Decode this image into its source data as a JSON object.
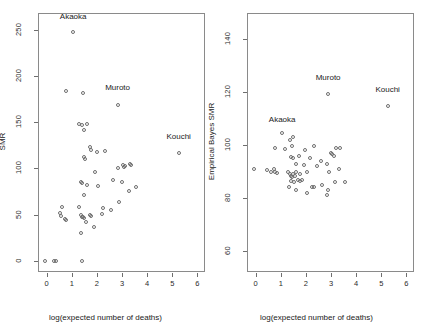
{
  "figure": {
    "panels": [
      {
        "id": "raw-smr",
        "xlabel": "log(expected number of deaths)",
        "ylabel": "SMR",
        "xticks": [
          "0",
          "1",
          "2",
          "3",
          "4",
          "5",
          "6"
        ],
        "yticks": [
          "0",
          "50",
          "100",
          "150",
          "200",
          "250"
        ]
      },
      {
        "id": "eb-smr",
        "xlabel": "log(expected number of deaths)",
        "ylabel": "Empirical Bayes SMR",
        "xticks": [
          "0",
          "1",
          "2",
          "3",
          "4",
          "5",
          "6"
        ],
        "yticks": [
          "60",
          "80",
          "100",
          "120",
          "140"
        ]
      }
    ]
  },
  "chart_data": [
    {
      "type": "scatter",
      "title": "",
      "xlabel": "log(expected number of deaths)",
      "ylabel": "SMR",
      "xlim": [
        -0.35,
        6.3
      ],
      "ylim": [
        -12,
        268
      ],
      "xticks": [
        0,
        1,
        2,
        3,
        4,
        5,
        6
      ],
      "yticks": [
        0,
        50,
        100,
        150,
        200,
        250
      ],
      "grid": false,
      "legend": null,
      "marker": "open-circle",
      "points": [
        {
          "x": 1.05,
          "y": 247
        },
        {
          "x": 0.78,
          "y": 184
        },
        {
          "x": 1.45,
          "y": 182
        },
        {
          "x": 2.82,
          "y": 169
        },
        {
          "x": 1.3,
          "y": 148
        },
        {
          "x": 1.42,
          "y": 147
        },
        {
          "x": 1.62,
          "y": 148
        },
        {
          "x": 1.5,
          "y": 142
        },
        {
          "x": 5.25,
          "y": 117
        },
        {
          "x": 1.72,
          "y": 123
        },
        {
          "x": 1.75,
          "y": 120
        },
        {
          "x": 2.0,
          "y": 118
        },
        {
          "x": 2.3,
          "y": 119
        },
        {
          "x": 1.5,
          "y": 112
        },
        {
          "x": 1.52,
          "y": 110
        },
        {
          "x": 3.05,
          "y": 104
        },
        {
          "x": 3.08,
          "y": 101
        },
        {
          "x": 3.12,
          "y": 103
        },
        {
          "x": 3.3,
          "y": 105
        },
        {
          "x": 3.35,
          "y": 104
        },
        {
          "x": 2.85,
          "y": 100
        },
        {
          "x": 1.92,
          "y": 96
        },
        {
          "x": 2.62,
          "y": 88
        },
        {
          "x": 2.98,
          "y": 85
        },
        {
          "x": 1.35,
          "y": 85
        },
        {
          "x": 1.42,
          "y": 84
        },
        {
          "x": 1.6,
          "y": 82
        },
        {
          "x": 2.02,
          "y": 81
        },
        {
          "x": 3.28,
          "y": 76
        },
        {
          "x": 3.55,
          "y": 80
        },
        {
          "x": 1.5,
          "y": 71
        },
        {
          "x": 2.88,
          "y": 64
        },
        {
          "x": 2.22,
          "y": 57
        },
        {
          "x": 2.55,
          "y": 55
        },
        {
          "x": 0.62,
          "y": 58
        },
        {
          "x": 1.3,
          "y": 58
        },
        {
          "x": 0.52,
          "y": 52
        },
        {
          "x": 0.58,
          "y": 49
        },
        {
          "x": 1.38,
          "y": 50
        },
        {
          "x": 1.42,
          "y": 48
        },
        {
          "x": 1.45,
          "y": 47
        },
        {
          "x": 1.48,
          "y": 46
        },
        {
          "x": 1.72,
          "y": 50
        },
        {
          "x": 1.78,
          "y": 49
        },
        {
          "x": 2.18,
          "y": 51
        },
        {
          "x": 0.72,
          "y": 45
        },
        {
          "x": 0.78,
          "y": 44
        },
        {
          "x": 1.55,
          "y": 42
        },
        {
          "x": 1.88,
          "y": 37
        },
        {
          "x": 1.38,
          "y": 30
        },
        {
          "x": -0.08,
          "y": 0
        },
        {
          "x": 0.3,
          "y": 0
        },
        {
          "x": 0.38,
          "y": 0
        },
        {
          "x": 1.42,
          "y": 0
        }
      ],
      "annotations": [
        {
          "label": "Akaoka",
          "x": 1.05,
          "y": 263
        },
        {
          "label": "Muroto",
          "x": 2.82,
          "y": 186
        },
        {
          "label": "Kouchi",
          "x": 5.25,
          "y": 133
        }
      ]
    },
    {
      "type": "scatter",
      "title": "",
      "xlabel": "log(expected number of deaths)",
      "ylabel": "Empirical Bayes SMR",
      "xlim": [
        -0.35,
        6.3
      ],
      "ylim": [
        52,
        150
      ],
      "xticks": [
        0,
        1,
        2,
        3,
        4,
        5,
        6
      ],
      "yticks": [
        60,
        80,
        100,
        120,
        140
      ],
      "grid": false,
      "legend": null,
      "marker": "open-circle",
      "points": [
        {
          "x": 2.88,
          "y": 119.5
        },
        {
          "x": 5.25,
          "y": 115
        },
        {
          "x": 1.05,
          "y": 104.5
        },
        {
          "x": 1.38,
          "y": 102
        },
        {
          "x": 1.5,
          "y": 103
        },
        {
          "x": 0.78,
          "y": 99
        },
        {
          "x": 1.18,
          "y": 98.5
        },
        {
          "x": 1.45,
          "y": 99.5
        },
        {
          "x": 1.95,
          "y": 98
        },
        {
          "x": 2.3,
          "y": 99.5
        },
        {
          "x": 3.2,
          "y": 99
        },
        {
          "x": 3.35,
          "y": 99
        },
        {
          "x": 2.98,
          "y": 97
        },
        {
          "x": 3.05,
          "y": 96.5
        },
        {
          "x": 3.12,
          "y": 96
        },
        {
          "x": 1.42,
          "y": 95.5
        },
        {
          "x": 1.48,
          "y": 95
        },
        {
          "x": 1.72,
          "y": 96
        },
        {
          "x": 2.15,
          "y": 95
        },
        {
          "x": 2.6,
          "y": 94
        },
        {
          "x": 1.62,
          "y": 93
        },
        {
          "x": 1.9,
          "y": 92.5
        },
        {
          "x": 2.42,
          "y": 92
        },
        {
          "x": 2.85,
          "y": 93
        },
        {
          "x": -0.08,
          "y": 91
        },
        {
          "x": 0.45,
          "y": 90.5
        },
        {
          "x": 0.62,
          "y": 90
        },
        {
          "x": 0.72,
          "y": 91
        },
        {
          "x": 0.78,
          "y": 90
        },
        {
          "x": 0.85,
          "y": 89.5
        },
        {
          "x": 1.3,
          "y": 90
        },
        {
          "x": 1.38,
          "y": 89
        },
        {
          "x": 1.42,
          "y": 88.5
        },
        {
          "x": 1.45,
          "y": 88
        },
        {
          "x": 1.5,
          "y": 89
        },
        {
          "x": 1.55,
          "y": 88.5
        },
        {
          "x": 1.6,
          "y": 90
        },
        {
          "x": 1.75,
          "y": 89
        },
        {
          "x": 2.05,
          "y": 90
        },
        {
          "x": 2.9,
          "y": 90
        },
        {
          "x": 3.3,
          "y": 91
        },
        {
          "x": 1.42,
          "y": 86.5
        },
        {
          "x": 1.52,
          "y": 86
        },
        {
          "x": 1.68,
          "y": 87
        },
        {
          "x": 1.78,
          "y": 86.5
        },
        {
          "x": 1.85,
          "y": 87
        },
        {
          "x": 2.22,
          "y": 84
        },
        {
          "x": 2.3,
          "y": 84
        },
        {
          "x": 2.62,
          "y": 85
        },
        {
          "x": 3.15,
          "y": 86
        },
        {
          "x": 3.55,
          "y": 86
        },
        {
          "x": 1.32,
          "y": 84
        },
        {
          "x": 1.62,
          "y": 83
        },
        {
          "x": 2.05,
          "y": 82
        },
        {
          "x": 2.88,
          "y": 83
        },
        {
          "x": 2.85,
          "y": 81
        }
      ],
      "annotations": [
        {
          "label": "Akaoka",
          "x": 1.05,
          "y": 109
        },
        {
          "label": "Muroto",
          "x": 2.88,
          "y": 125
        },
        {
          "label": "Kouchi",
          "x": 5.25,
          "y": 120.5
        }
      ]
    }
  ]
}
